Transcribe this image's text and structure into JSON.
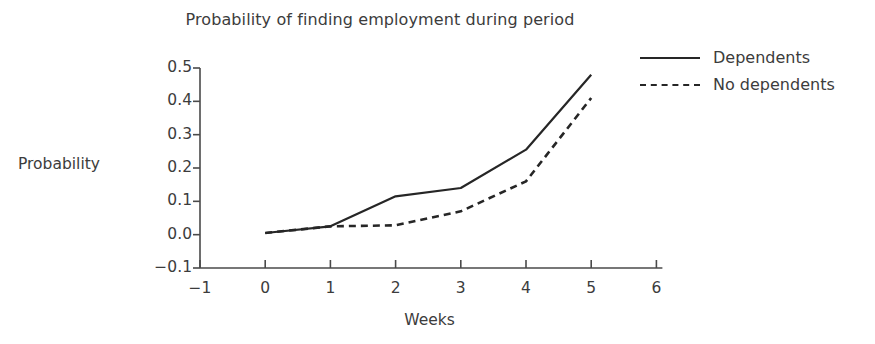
{
  "chart_data": {
    "type": "line",
    "title": "Probability of finding employment during period",
    "xlabel": "Weeks",
    "ylabel": "Probability",
    "xlim": [
      -1,
      6
    ],
    "ylim": [
      -0.1,
      0.5
    ],
    "xticks": [
      "−1",
      "0",
      "1",
      "2",
      "3",
      "4",
      "5",
      "6"
    ],
    "xtick_values": [
      -1,
      0,
      1,
      2,
      3,
      4,
      5,
      6
    ],
    "yticks": [
      "0.5",
      "0.4",
      "0.3",
      "0.2",
      "0.1",
      "0.0",
      "−0.1"
    ],
    "ytick_values": [
      0.5,
      0.4,
      0.3,
      0.2,
      0.1,
      0.0,
      -0.1
    ],
    "grid": false,
    "legend_position": "upper right",
    "x": [
      0,
      1,
      2,
      3,
      4,
      5
    ],
    "series": [
      {
        "name": "Dependents",
        "style": "solid",
        "color": "#262626",
        "values": [
          0.005,
          0.025,
          0.115,
          0.14,
          0.255,
          0.48
        ]
      },
      {
        "name": "No dependents",
        "style": "dashed",
        "color": "#262626",
        "values": [
          0.005,
          0.025,
          0.028,
          0.07,
          0.16,
          0.41
        ]
      }
    ]
  },
  "legend": {
    "items": [
      {
        "label": "Dependents",
        "style": "solid"
      },
      {
        "label": "No dependents",
        "style": "dashed"
      }
    ]
  }
}
